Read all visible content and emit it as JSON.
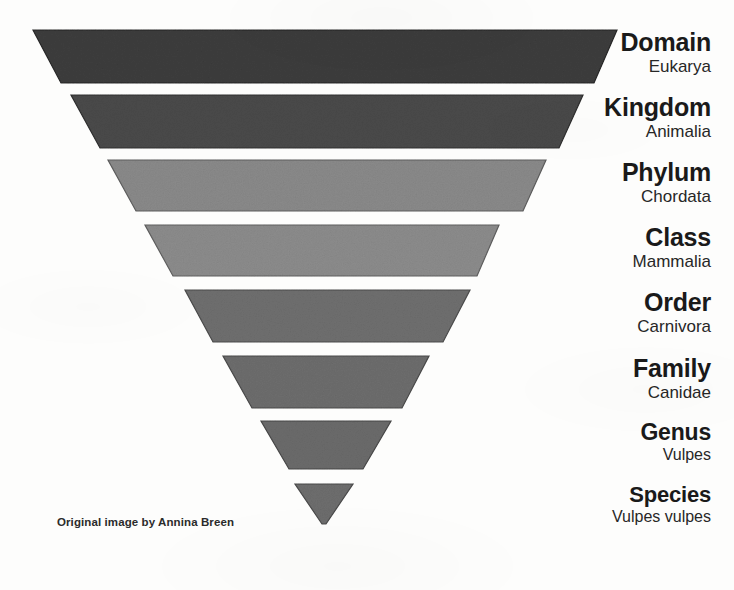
{
  "canvas": {
    "width": 734,
    "height": 590,
    "background_color": "#fdfdfc"
  },
  "diagram": {
    "type": "inverted-funnel",
    "title_visible": false,
    "label_right_edge_x": 711
  },
  "attribution": {
    "text": "Original image by Annina Breen"
  },
  "levels": [
    {
      "id": "domain",
      "rank": "Domain",
      "taxon": "Eukarya",
      "fill": "#3d3d3d",
      "stroke": "#262626",
      "rank_font_size": 25,
      "taxon_font_size": 17,
      "label_top": 30,
      "shape": {
        "top_y": 30,
        "bottom_y": 83,
        "top_left_x": 33,
        "top_right_x": 617,
        "bottom_left_x": 61,
        "bottom_right_x": 594
      }
    },
    {
      "id": "kingdom",
      "rank": "Kingdom",
      "taxon": "Animalia",
      "fill": "#4a4a4a",
      "stroke": "#2e2e2e",
      "rank_font_size": 25,
      "taxon_font_size": 17,
      "label_top": 95,
      "shape": {
        "top_y": 95,
        "bottom_y": 148,
        "top_left_x": 71,
        "top_right_x": 583,
        "bottom_left_x": 100,
        "bottom_right_x": 559
      }
    },
    {
      "id": "phylum",
      "rank": "Phylum",
      "taxon": "Chordata",
      "fill": "#8a8a8a",
      "stroke": "#5e5e5e",
      "rank_font_size": 25,
      "taxon_font_size": 17,
      "label_top": 160,
      "shape": {
        "top_y": 160,
        "bottom_y": 211,
        "top_left_x": 108,
        "top_right_x": 546,
        "bottom_left_x": 136,
        "bottom_right_x": 523
      }
    },
    {
      "id": "class",
      "rank": "Class",
      "taxon": "Mammalia",
      "fill": "#8c8c8c",
      "stroke": "#606060",
      "rank_font_size": 25,
      "taxon_font_size": 17,
      "label_top": 225,
      "shape": {
        "top_y": 225,
        "bottom_y": 276,
        "top_left_x": 145,
        "top_right_x": 499,
        "bottom_left_x": 173,
        "bottom_right_x": 477
      }
    },
    {
      "id": "order",
      "rank": "Order",
      "taxon": "Carnivora",
      "fill": "#6f6f6f",
      "stroke": "#4c4c4c",
      "rank_font_size": 25,
      "taxon_font_size": 17,
      "label_top": 290,
      "shape": {
        "top_y": 290,
        "bottom_y": 342,
        "top_left_x": 185,
        "top_right_x": 470,
        "bottom_left_x": 213,
        "bottom_right_x": 443
      }
    },
    {
      "id": "family",
      "rank": "Family",
      "taxon": "Canidae",
      "fill": "#6d6d6d",
      "stroke": "#4a4a4a",
      "rank_font_size": 25,
      "taxon_font_size": 17,
      "label_top": 356,
      "shape": {
        "top_y": 356,
        "bottom_y": 408,
        "top_left_x": 223,
        "top_right_x": 429,
        "bottom_left_x": 252,
        "bottom_right_x": 402
      }
    },
    {
      "id": "genus",
      "rank": "Genus",
      "taxon": "Vulpes",
      "fill": "#6b6b6b",
      "stroke": "#484848",
      "rank_font_size": 23,
      "taxon_font_size": 16,
      "label_top": 421,
      "shape": {
        "top_y": 421,
        "bottom_y": 469,
        "top_left_x": 261,
        "top_right_x": 391,
        "bottom_left_x": 289,
        "bottom_right_x": 363
      }
    },
    {
      "id": "species",
      "rank": "Species",
      "taxon": "Vulpes vulpes",
      "fill": "#6e6e6e",
      "stroke": "#4a4a4a",
      "rank_font_size": 22,
      "taxon_font_size": 16,
      "label_top": 484,
      "shape": {
        "top_y": 484,
        "bottom_y": 524,
        "top_left_x": 295,
        "top_right_x": 353,
        "bottom_left_x": 322,
        "bottom_right_x": 326
      }
    }
  ]
}
